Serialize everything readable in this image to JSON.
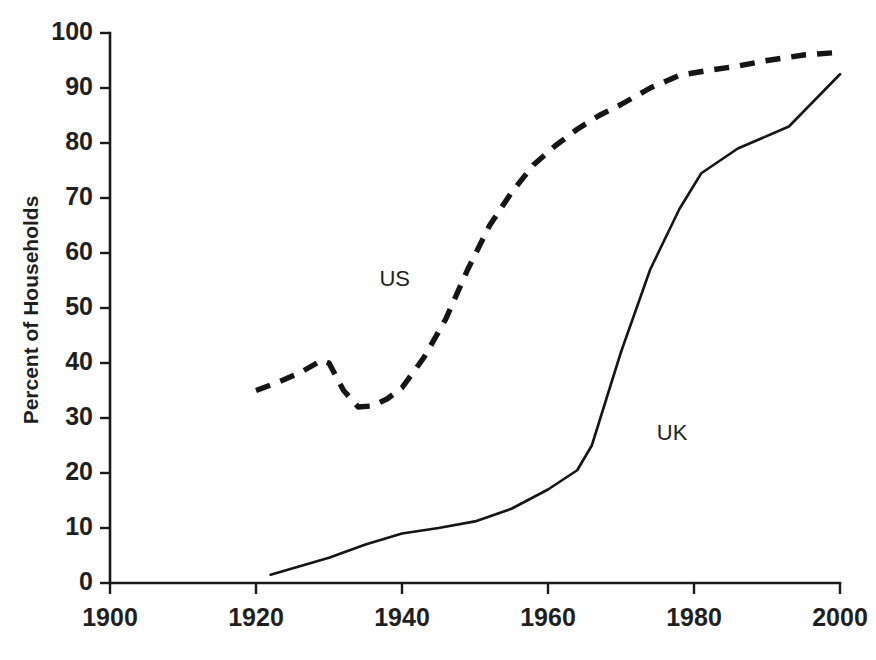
{
  "chart_data": {
    "type": "line",
    "title": "",
    "subtitle": "",
    "xlabel": "",
    "ylabel": "Percent of Households",
    "xlim": [
      1900,
      2000
    ],
    "ylim": [
      0,
      100
    ],
    "grid": false,
    "legend_position": "inline-annotation",
    "x_ticks": [
      1900,
      1920,
      1940,
      1960,
      1980,
      2000
    ],
    "x_tick_labels": [
      "1900",
      "1920",
      "1940",
      "1960",
      "1980",
      "2000"
    ],
    "y_ticks": [
      0,
      10,
      20,
      30,
      40,
      50,
      60,
      70,
      80,
      90,
      100
    ],
    "y_tick_labels": [
      "0",
      "10",
      "20",
      "30",
      "40",
      "50",
      "60",
      "70",
      "80",
      "90",
      "100"
    ],
    "series": [
      {
        "name": "US",
        "style": "dashed",
        "color": "#151515",
        "label_x": 1939,
        "label_y": 55,
        "points": [
          [
            1920,
            35.0
          ],
          [
            1923,
            36.5
          ],
          [
            1926,
            38.2
          ],
          [
            1929,
            40.5
          ],
          [
            1930,
            40.0
          ],
          [
            1932,
            35.0
          ],
          [
            1934,
            32.0
          ],
          [
            1936,
            32.2
          ],
          [
            1938,
            33.5
          ],
          [
            1940,
            35.5
          ],
          [
            1943,
            41.0
          ],
          [
            1946,
            48.0
          ],
          [
            1949,
            57.0
          ],
          [
            1952,
            65.0
          ],
          [
            1955,
            71.0
          ],
          [
            1958,
            76.0
          ],
          [
            1961,
            79.5
          ],
          [
            1964,
            82.5
          ],
          [
            1967,
            85.0
          ],
          [
            1970,
            87.0
          ],
          [
            1974,
            90.0
          ],
          [
            1978,
            92.3
          ],
          [
            1982,
            93.2
          ],
          [
            1986,
            94.0
          ],
          [
            1990,
            95.0
          ],
          [
            1995,
            96.0
          ],
          [
            2000,
            96.5
          ]
        ]
      },
      {
        "name": "UK",
        "style": "solid",
        "color": "#151515",
        "label_x": 1977,
        "label_y": 27,
        "points": [
          [
            1922,
            1.5
          ],
          [
            1930,
            4.6
          ],
          [
            1935,
            7.0
          ],
          [
            1940,
            9.0
          ],
          [
            1945,
            10.0
          ],
          [
            1950,
            11.2
          ],
          [
            1955,
            13.5
          ],
          [
            1960,
            17.0
          ],
          [
            1964,
            20.5
          ],
          [
            1966,
            25.0
          ],
          [
            1970,
            42.0
          ],
          [
            1974,
            57.0
          ],
          [
            1978,
            68.0
          ],
          [
            1981,
            74.5
          ],
          [
            1986,
            79.0
          ],
          [
            1993,
            83.0
          ],
          [
            2000,
            92.5
          ]
        ]
      }
    ]
  },
  "axes": {
    "y_axis_title": "Percent of Households"
  }
}
